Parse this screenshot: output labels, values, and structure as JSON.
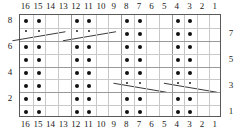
{
  "chart_data": {
    "type": "heatmap",
    "title": "",
    "subtitle": "",
    "xlabel": "",
    "ylabel": "",
    "grid": true,
    "legend_position": "none",
    "columns": 16,
    "rows": 8,
    "column_labels_top": [
      "16",
      "15",
      "14",
      "13",
      "12",
      "11",
      "10",
      "9",
      "8",
      "7",
      "6",
      "5",
      "4",
      "3",
      "2",
      "1"
    ],
    "column_labels_bottom": [
      "16",
      "15",
      "14",
      "13",
      "12",
      "11",
      "10",
      "9",
      "8",
      "7",
      "6",
      "5",
      "4",
      "3",
      "2",
      "1"
    ],
    "row_labels_left": [
      "8",
      "6",
      "4",
      "2"
    ],
    "row_labels_right": [
      "7",
      "5",
      "3",
      "1"
    ],
    "symbols": {
      "dot": "purl-stitch-dot",
      "diagonal": "cable-cross-line",
      "tick": "small-tick-mark"
    },
    "dot_columns_by_row": {
      "8": [
        16,
        15,
        12,
        11,
        8,
        7,
        4,
        3
      ],
      "7": [
        8,
        7,
        4,
        3
      ],
      "6": [
        16,
        15,
        12,
        11,
        8,
        7,
        4,
        3
      ],
      "5": [
        16,
        15,
        12,
        11,
        8,
        7,
        4,
        3
      ],
      "4": [
        16,
        15,
        12,
        11,
        8,
        7,
        4,
        3
      ],
      "3": [
        16,
        15,
        12,
        11
      ],
      "2": [
        16,
        15,
        12,
        11,
        8,
        7,
        4,
        3
      ],
      "1": [
        16,
        15,
        12,
        11,
        8,
        7,
        4,
        3
      ]
    },
    "tick_columns_by_row": {
      "7": [
        16,
        15,
        12,
        11
      ],
      "3": [
        8,
        7,
        4,
        3
      ]
    },
    "diagonal_lines": [
      {
        "row": 7,
        "from_col": 16.6,
        "to_col": 12.4,
        "direction": "rising"
      },
      {
        "row": 7,
        "from_col": 12.6,
        "to_col": 8.4,
        "direction": "rising"
      },
      {
        "row": 3,
        "from_col": 8.6,
        "to_col": 4.4,
        "direction": "falling"
      },
      {
        "row": 3,
        "from_col": 4.6,
        "to_col": 0.4,
        "direction": "falling"
      }
    ],
    "colors": {
      "dot": "#111111",
      "grid_minor": "#c9c9c9",
      "grid_major": "#9a9a9a",
      "border": "#5a5a5a",
      "line": "#3a3a3a",
      "text": "#1a1a1a",
      "background": "#ffffff"
    }
  }
}
